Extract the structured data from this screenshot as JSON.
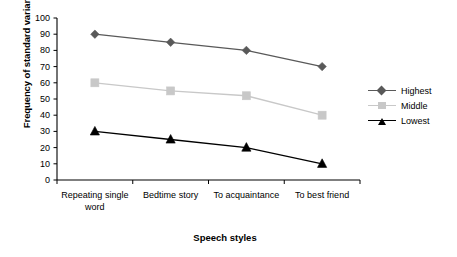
{
  "chart_data": {
    "type": "line",
    "title": "",
    "xlabel": "Speech styles",
    "ylabel": "Frequency of standard variant",
    "categories": [
      "Repeating single word",
      "Bedtime story",
      "To acquaintance",
      "To best friend"
    ],
    "ylim": [
      0,
      100
    ],
    "yticks": [
      0,
      10,
      20,
      30,
      40,
      50,
      60,
      70,
      80,
      90,
      100
    ],
    "ytick_labels": [
      "0",
      "10",
      "20",
      "30",
      "40",
      "50",
      "60",
      "70",
      "80",
      "90",
      "100"
    ],
    "grid": false,
    "legend_position": "right",
    "series": [
      {
        "name": "Highest",
        "values": [
          90,
          85,
          80,
          70
        ],
        "color": "#595959",
        "marker": "diamond"
      },
      {
        "name": "Middle",
        "values": [
          60,
          55,
          52,
          40
        ],
        "color": "#c8c8c8",
        "marker": "square"
      },
      {
        "name": "Lowest",
        "values": [
          30,
          25,
          20,
          10
        ],
        "color": "#000000",
        "marker": "triangle"
      }
    ]
  },
  "axes": {
    "y_title": "Frequency of standard variant",
    "x_title": "Speech styles"
  },
  "legend": {
    "items": [
      {
        "label": "Highest",
        "color": "#595959",
        "marker": "diamond"
      },
      {
        "label": "Middle",
        "color": "#c8c8c8",
        "marker": "square"
      },
      {
        "label": "Lowest",
        "color": "#000000",
        "marker": "triangle"
      }
    ]
  }
}
